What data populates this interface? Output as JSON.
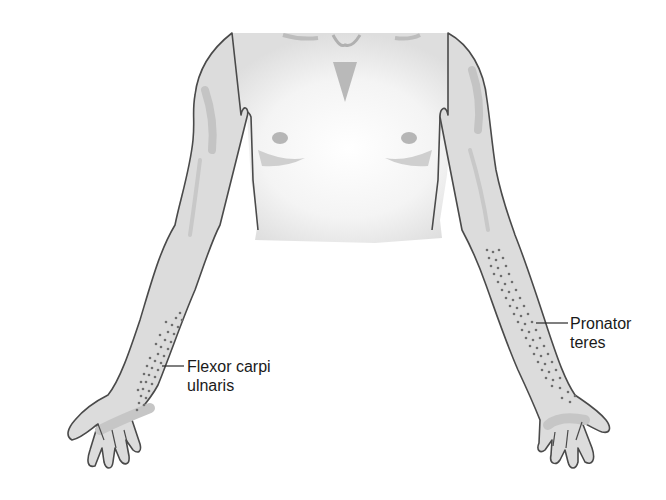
{
  "figure": {
    "colors": {
      "skin": "#dcdcdc",
      "skin_light": "#f2f2f2",
      "outline": "#4a4a4a",
      "shade": "#c2c2c2",
      "stipple": "#6e6e6e",
      "label_text": "#1a1a1a"
    }
  },
  "labels": [
    {
      "id": "flexor-carpi-ulnaris",
      "line1": "Flexor carpi",
      "line2": "ulnaris",
      "side": "right-of-figure-left-arm"
    },
    {
      "id": "pronator-teres",
      "line1": "Pronator",
      "line2": "teres",
      "side": "right-arm"
    }
  ]
}
